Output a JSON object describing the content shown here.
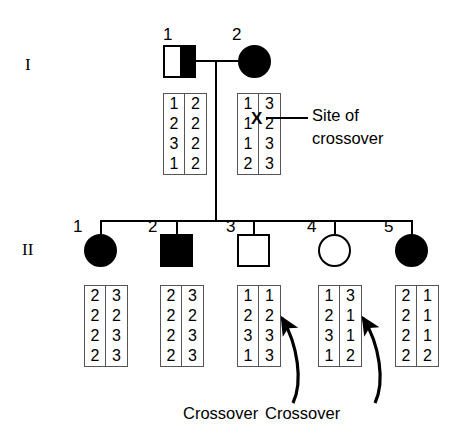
{
  "figure": {
    "stroke_color": "#000000",
    "background_color": "#ffffff",
    "box_border_color": "#555555"
  },
  "generations": [
    {
      "id": "I",
      "label": "I"
    },
    {
      "id": "II",
      "label": "II"
    }
  ],
  "individuals": [
    {
      "key": "I-1",
      "generation": "I",
      "number": "1",
      "sex": "male",
      "shape": "square",
      "fill": "half-filled-right",
      "affected": "partial",
      "haplotypes": [
        {
          "name": "paternal",
          "alleles": [
            "1",
            "2",
            "3",
            "1"
          ]
        },
        {
          "name": "maternal",
          "alleles": [
            "2",
            "2",
            "2",
            "2"
          ]
        }
      ]
    },
    {
      "key": "I-2",
      "generation": "I",
      "number": "2",
      "sex": "female",
      "shape": "circle",
      "fill": "filled",
      "affected": "yes",
      "haplotypes": [
        {
          "name": "paternal",
          "alleles": [
            "1",
            "1",
            "1",
            "2"
          ]
        },
        {
          "name": "maternal",
          "alleles": [
            "3",
            "2",
            "3",
            "3"
          ]
        }
      ],
      "crossover_marker": {
        "symbol": "X",
        "between_rows": [
          1,
          2
        ],
        "label": "Site of crossover"
      }
    },
    {
      "key": "II-1",
      "generation": "II",
      "number": "1",
      "sex": "female",
      "shape": "circle",
      "fill": "filled",
      "affected": "yes",
      "haplotypes": [
        {
          "name": "paternal",
          "alleles": [
            "2",
            "2",
            "2",
            "2"
          ]
        },
        {
          "name": "maternal",
          "alleles": [
            "3",
            "2",
            "3",
            "3"
          ]
        }
      ]
    },
    {
      "key": "II-2",
      "generation": "II",
      "number": "2",
      "sex": "male",
      "shape": "square",
      "fill": "filled",
      "affected": "yes",
      "haplotypes": [
        {
          "name": "paternal",
          "alleles": [
            "2",
            "2",
            "2",
            "2"
          ]
        },
        {
          "name": "maternal",
          "alleles": [
            "3",
            "2",
            "3",
            "3"
          ]
        }
      ]
    },
    {
      "key": "II-3",
      "generation": "II",
      "number": "3",
      "sex": "male",
      "shape": "square",
      "fill": "unfilled",
      "affected": "no",
      "haplotypes": [
        {
          "name": "paternal",
          "alleles": [
            "1",
            "2",
            "3",
            "1"
          ]
        },
        {
          "name": "maternal",
          "alleles": [
            "1",
            "2",
            "3",
            "3"
          ]
        }
      ],
      "crossover_label": "Crossover"
    },
    {
      "key": "II-4",
      "generation": "II",
      "number": "4",
      "sex": "female",
      "shape": "circle",
      "fill": "unfilled",
      "affected": "no",
      "haplotypes": [
        {
          "name": "paternal",
          "alleles": [
            "1",
            "2",
            "3",
            "1"
          ]
        },
        {
          "name": "maternal",
          "alleles": [
            "3",
            "1",
            "1",
            "2"
          ]
        }
      ],
      "crossover_label": "Crossover"
    },
    {
      "key": "II-5",
      "generation": "II",
      "number": "5",
      "sex": "female",
      "shape": "circle",
      "fill": "filled",
      "affected": "yes",
      "haplotypes": [
        {
          "name": "paternal",
          "alleles": [
            "2",
            "2",
            "2",
            "2"
          ]
        },
        {
          "name": "maternal",
          "alleles": [
            "1",
            "1",
            "1",
            "2"
          ]
        }
      ]
    }
  ],
  "annotations": {
    "site_of_crossover": {
      "line1": "Site of",
      "line2": "crossover"
    },
    "crossover_left": "Crossover",
    "crossover_right": "Crossover"
  }
}
